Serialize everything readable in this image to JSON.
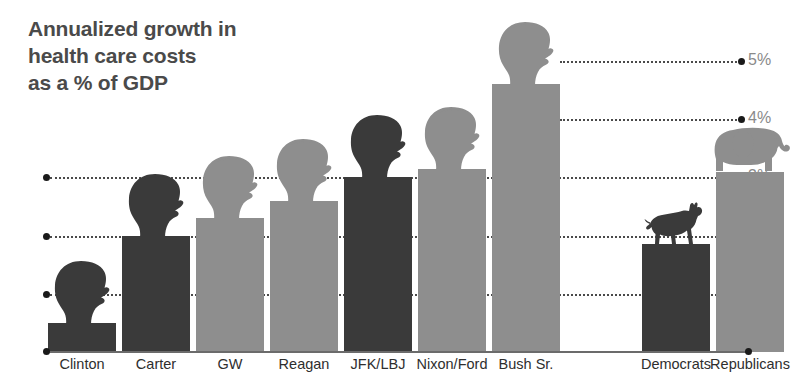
{
  "title": "Annualized growth in\nhealth care costs\nas a % of GDP",
  "colors": {
    "democrat_dark": "#3a3a3a",
    "republican_light": "#8e8e8e",
    "title_text": "#4a4a4a",
    "axis_label": "#8a8a8a",
    "gridline": "#2b2b2b",
    "background": "#ffffff"
  },
  "axis": {
    "ticks": [
      "1%",
      "2%",
      "3%",
      "4%",
      "5%"
    ],
    "tick_values": [
      1,
      2,
      3,
      4,
      5
    ],
    "unit": "%"
  },
  "chart_data": {
    "type": "bar",
    "title": "Annualized growth in health care costs as a % of GDP",
    "xlabel": "",
    "ylabel": "% of GDP",
    "ylim": [
      0,
      5.5
    ],
    "grid": true,
    "legend": "none",
    "categories": [
      "Clinton",
      "Carter",
      "GW",
      "Reagan",
      "JFK/LBJ",
      "Nixon/Ford",
      "Bush Sr.",
      "Democrats",
      "Republicans"
    ],
    "values": [
      0.5,
      2.0,
      2.3,
      2.6,
      3.0,
      3.15,
      4.6,
      1.85,
      3.1
    ],
    "party": [
      "Democrat",
      "Democrat",
      "Republican",
      "Republican",
      "Democrat",
      "Republican",
      "Republican",
      "Democrat",
      "Republican"
    ],
    "icons": [
      "head-silhouette",
      "head-silhouette",
      "head-silhouette",
      "head-silhouette",
      "head-silhouette",
      "head-silhouette",
      "head-silhouette",
      "donkey-icon",
      "elephant-icon"
    ]
  },
  "bars": [
    {
      "label": "Clinton",
      "value": 0.5,
      "party": "Democrat",
      "icon": "head-silhouette"
    },
    {
      "label": "Carter",
      "value": 2.0,
      "party": "Democrat",
      "icon": "head-silhouette"
    },
    {
      "label": "GW",
      "value": 2.3,
      "party": "Republican",
      "icon": "head-silhouette"
    },
    {
      "label": "Reagan",
      "value": 2.6,
      "party": "Republican",
      "icon": "head-silhouette"
    },
    {
      "label": "JFK/LBJ",
      "value": 3.0,
      "party": "Democrat",
      "icon": "head-silhouette"
    },
    {
      "label": "Nixon/Ford",
      "value": 3.15,
      "party": "Republican",
      "icon": "head-silhouette"
    },
    {
      "label": "Bush Sr.",
      "value": 4.6,
      "party": "Republican",
      "icon": "head-silhouette"
    },
    {
      "label": "Democrats",
      "value": 1.85,
      "party": "Democrat",
      "icon": "donkey-icon"
    },
    {
      "label": "Republicans",
      "value": 3.1,
      "party": "Republican",
      "icon": "elephant-icon"
    }
  ]
}
